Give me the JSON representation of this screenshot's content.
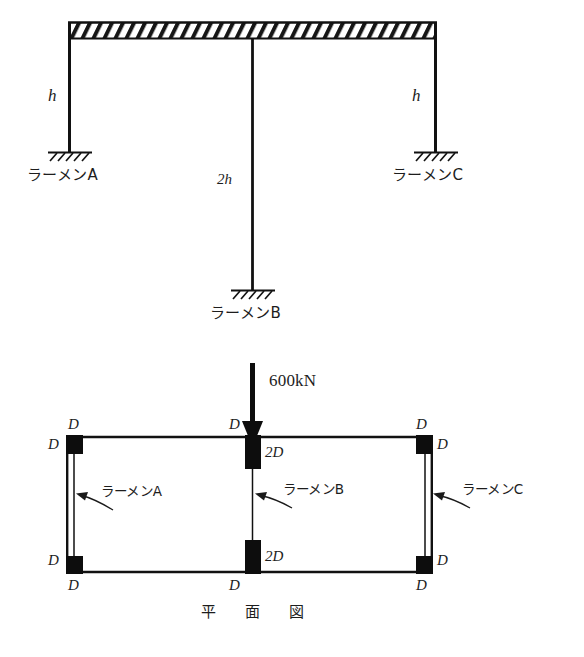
{
  "figure": {
    "kind": "structural-engineering-diagram",
    "views": [
      {
        "id": "elevation",
        "caption": ""
      },
      {
        "id": "plan",
        "caption": "平　面　図"
      }
    ]
  },
  "elevation": {
    "name": "elevation-view",
    "beam": {
      "label": "",
      "hatch": "diagonal"
    },
    "columns": [
      {
        "id": "A",
        "height_label": "h",
        "frame_label": "ラーメンA",
        "support": "fixed"
      },
      {
        "id": "B",
        "height_label": "2h",
        "frame_label": "ラーメンB",
        "support": "fixed"
      },
      {
        "id": "C",
        "height_label": "h",
        "frame_label": "ラーメンC",
        "support": "fixed"
      }
    ],
    "height_labels": {
      "left": "h",
      "middle": "2h",
      "right": "h"
    },
    "frame_labels": {
      "left": "ラーメンA",
      "middle": "ラーメンB",
      "right": "ラーメンC"
    }
  },
  "plan": {
    "name": "plan-view",
    "caption": "平　面　図",
    "load": {
      "value": "600kN",
      "direction": "down",
      "arrow": "down-arrow"
    },
    "frame_labels": {
      "left": "ラーメンA",
      "middle": "ラーメンB",
      "right": "ラーメンC"
    },
    "column_marks": {
      "corner": "D",
      "middle": "2D"
    },
    "corner_labels": {
      "top_left_outer": "D",
      "top_left_inner": "D",
      "top_mid_outer": "D",
      "top_mid_inner": "2D",
      "top_right_outer": "D",
      "top_right_inner": "D",
      "bottom_left_inner": "D",
      "bottom_left_outer": "D",
      "bottom_mid_inner": "2D",
      "bottom_mid_outer": "D",
      "bottom_right_inner": "D",
      "bottom_right_outer": "D"
    }
  },
  "colors": {
    "ink": "#1a1a1a",
    "line": "#111111",
    "fill": "#0d0d0d",
    "paper": "#ffffff"
  }
}
